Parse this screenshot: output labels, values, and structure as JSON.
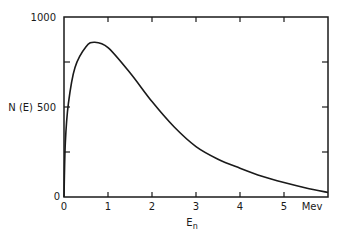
{
  "chart_data": {
    "type": "line",
    "title": "",
    "xlabel": "E_n",
    "xlabel_main": "E",
    "xlabel_sub": "n",
    "ylabel": "N (E)",
    "x_unit_label": "Mev",
    "xlim": [
      0,
      6
    ],
    "ylim": [
      0,
      1000
    ],
    "x_ticks": [
      0,
      1,
      2,
      3,
      4,
      5,
      6
    ],
    "x_tick_labels": [
      "0",
      "1",
      "2",
      "3",
      "4",
      "5",
      "Mev"
    ],
    "y_ticks": [
      0,
      250,
      500,
      750,
      1000
    ],
    "y_tick_labels": [
      "0",
      "",
      "500",
      "",
      "1000"
    ],
    "grid": false,
    "legend": null,
    "series": [
      {
        "name": "N(E)",
        "color": "#1a1a1a",
        "x": [
          0,
          0.03,
          0.1,
          0.25,
          0.5,
          0.7,
          1.0,
          1.5,
          2.0,
          2.5,
          3.0,
          3.5,
          4.0,
          4.5,
          5.0,
          5.5,
          6.0
        ],
        "y": [
          0,
          300,
          520,
          720,
          835,
          860,
          830,
          690,
          530,
          390,
          280,
          210,
          160,
          115,
          80,
          50,
          25
        ]
      }
    ]
  },
  "labels": {
    "y_axis_title": "N (E)",
    "y_500": "500",
    "y_1000": "1000",
    "y_0": "0",
    "x_0": "0",
    "x_1": "1",
    "x_2": "2",
    "x_3": "3",
    "x_4": "4",
    "x_5": "5",
    "x_unit": "Mev",
    "x_title_main": "E",
    "x_title_sub": "n"
  }
}
